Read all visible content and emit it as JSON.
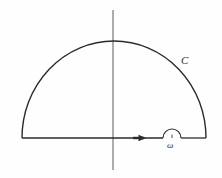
{
  "figure": {
    "kind": "complex-contour-integration-diagram",
    "background_color": "#fefefe",
    "stroke_color": "#2b2b2b",
    "axis_color": "#555555",
    "labels": {
      "contour": "C",
      "pole": "ω"
    },
    "icon_names": {
      "direction_arrow": "arrow-right-icon",
      "large_arc": "semicircular-contour-arc",
      "small_arc": "small-semicircular-detour",
      "real_axis": "real-axis-line",
      "imaginary_axis": "imaginary-axis-line"
    },
    "geometry": {
      "real_axis": {
        "x1": 22,
        "y1": 138,
        "x2": 206,
        "y2": 138
      },
      "imaginary_axis": {
        "x1": 113,
        "y1": 10,
        "x2": 113,
        "y2": 170
      },
      "large_arc": {
        "left_endpoint_x": 22,
        "right_endpoint_x": 206,
        "baseline_y": 138,
        "apex_x": 114,
        "apex_y": 41,
        "radius_x": 92,
        "radius_y": 97
      },
      "small_arc": {
        "center_x": 172,
        "baseline_y": 138,
        "radius": 9
      },
      "direction_arrow": {
        "tip_x": 146,
        "tail_x": 134,
        "y": 138
      },
      "label_positions": {
        "contour": {
          "x": 185,
          "y": 62
        },
        "pole": {
          "x": 172,
          "y": 147
        }
      }
    }
  }
}
